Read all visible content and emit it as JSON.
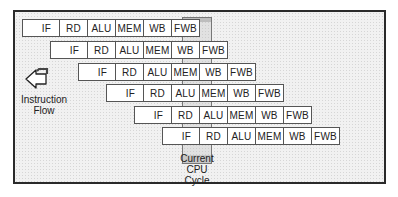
{
  "diagram": {
    "stages": [
      "IF",
      "RD",
      "ALU",
      "MEM",
      "WB",
      "FWB"
    ],
    "rows": [
      {
        "instruction": 1,
        "start_cycle": 0,
        "stages": [
          "IF",
          "RD",
          "ALU",
          "MEM",
          "WB",
          "FWB"
        ]
      },
      {
        "instruction": 2,
        "start_cycle": 1,
        "stages": [
          "IF",
          "RD",
          "ALU",
          "MEM",
          "WB",
          "FWB"
        ]
      },
      {
        "instruction": 3,
        "start_cycle": 2,
        "stages": [
          "IF",
          "RD",
          "ALU",
          "MEM",
          "WB",
          "FWB"
        ]
      },
      {
        "instruction": 4,
        "start_cycle": 3,
        "stages": [
          "IF",
          "RD",
          "ALU",
          "MEM",
          "WB",
          "FWB"
        ]
      },
      {
        "instruction": 5,
        "start_cycle": 4,
        "stages": [
          "IF",
          "RD",
          "ALU",
          "MEM",
          "WB",
          "FWB"
        ]
      },
      {
        "instruction": 6,
        "start_cycle": 5,
        "stages": [
          "IF",
          "RD",
          "ALU",
          "MEM",
          "WB",
          "FWB"
        ]
      }
    ],
    "current_cycle_index": 5,
    "instruction_flow_label_line1": "Instruction",
    "instruction_flow_label_line2": "Flow",
    "current_cycle_label_line1": "Current",
    "current_cycle_label_line2": "CPU",
    "current_cycle_label_line3": "Cycle",
    "icons": {
      "flow_arrow": "arrow-left-outline-icon"
    },
    "colors": {
      "border": "#2a2a2a",
      "cell_bg": "#ffffff",
      "highlight": "#bdbdbd"
    }
  }
}
